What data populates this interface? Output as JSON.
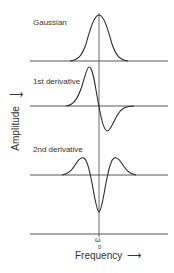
{
  "diagram": {
    "title": "",
    "labels": {
      "gaussian": "Gaussian",
      "first_derivative": "1st derivative",
      "second_derivative": "2nd derivative"
    },
    "axes": {
      "y_label": "Amplitude",
      "x_label": "Frequency",
      "y_arrow": "↑",
      "x_arrow": "→",
      "center_symbol": "ω",
      "center_subscript": "0"
    },
    "colors": {
      "line": "#2a2a2a",
      "background": "#ffffff"
    }
  }
}
